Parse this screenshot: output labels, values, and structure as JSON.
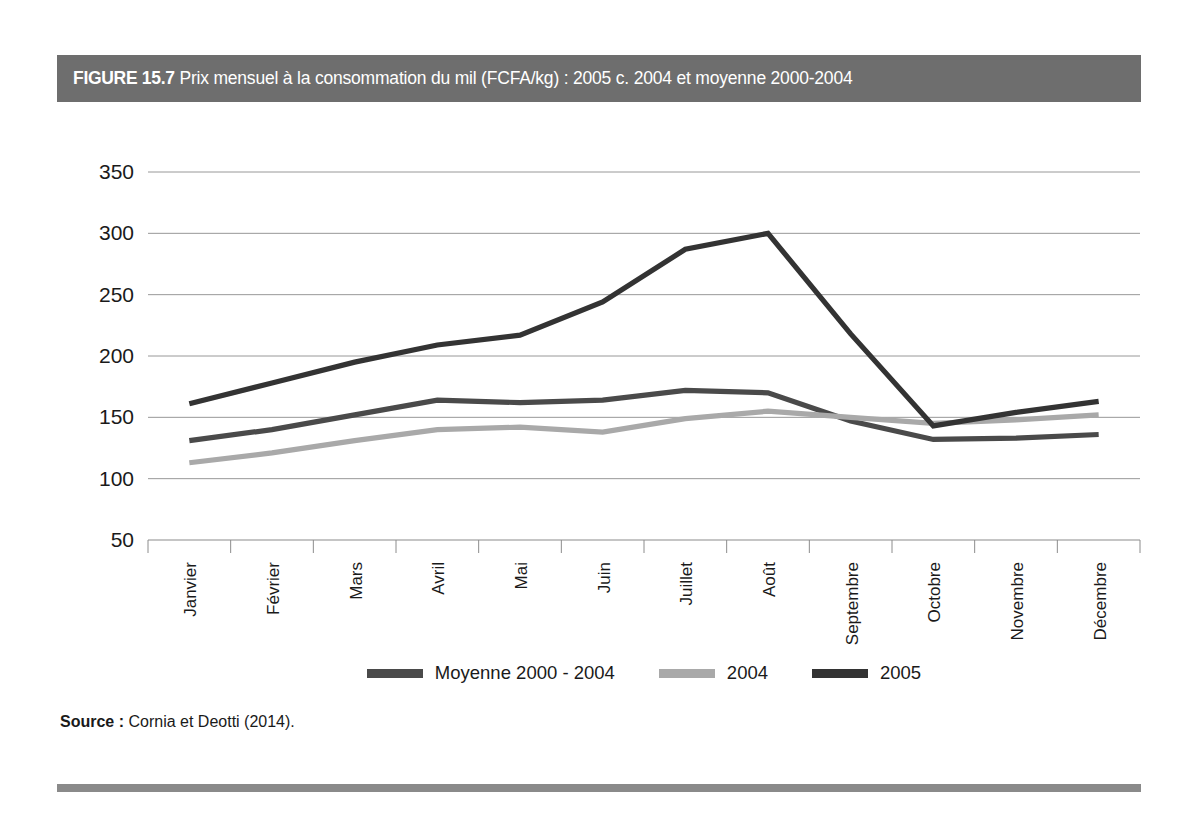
{
  "figure": {
    "number_label": "FIGURE 15.7",
    "title": "Prix mensuel à la consommation du mil (FCFA/kg) : 2005 c. 2004 et moyenne 2000-2004",
    "header_bg": "#6e6e6e",
    "header_fg": "#ffffff",
    "rule_color": "#8a8a8a"
  },
  "source": {
    "label": "Source :",
    "text": "Cornia et Deotti (2014)."
  },
  "legend": {
    "position": "bottom-center",
    "items": [
      {
        "label": "Moyenne 2000 - 2004",
        "color": "#4a4a4a"
      },
      {
        "label": "2004",
        "color": "#a9a9a9"
      },
      {
        "label": "2005",
        "color": "#333333"
      }
    ]
  },
  "chart_data": {
    "type": "line",
    "title": "Prix mensuel à la consommation du mil (FCFA/kg) : 2005 c. 2004 et moyenne 2000-2004",
    "xlabel": "",
    "ylabel": "",
    "grid": true,
    "legend_position": "bottom-center",
    "categories": [
      "Janvier",
      "Février",
      "Mars",
      "Avril",
      "Mai",
      "Juin",
      "Juillet",
      "Août",
      "Septembre",
      "Octobre",
      "Novembre",
      "Décembre"
    ],
    "ylim": [
      50,
      350
    ],
    "yticks": [
      50,
      100,
      150,
      200,
      250,
      300,
      350
    ],
    "ytick_labels": [
      "50",
      "100",
      "150",
      "200",
      "250",
      "300",
      "350"
    ],
    "series": [
      {
        "name": "Moyenne 2000 - 2004",
        "color": "#4a4a4a",
        "values": [
          131,
          140,
          152,
          164,
          162,
          164,
          172,
          170,
          147,
          132,
          133,
          136
        ]
      },
      {
        "name": "2004",
        "color": "#a9a9a9",
        "values": [
          113,
          121,
          131,
          140,
          142,
          138,
          149,
          155,
          150,
          145,
          148,
          152
        ]
      },
      {
        "name": "2005",
        "color": "#333333",
        "values": [
          161,
          178,
          195,
          209,
          217,
          244,
          287,
          300,
          218,
          143,
          154,
          163
        ]
      }
    ]
  }
}
